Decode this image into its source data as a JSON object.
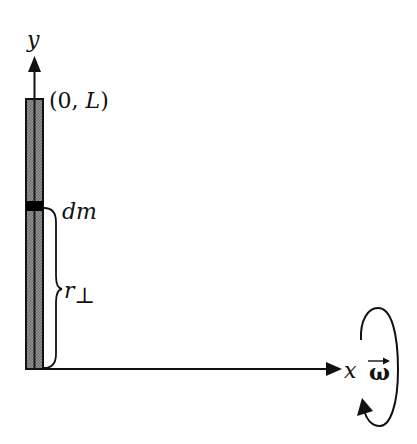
{
  "diagram": {
    "axes": {
      "x_label": "x",
      "y_label": "y"
    },
    "labels": {
      "top_point_open": "(0, ",
      "top_point_var": "L",
      "top_point_close": ")",
      "mass_element": "dm",
      "perp_distance_main": "r",
      "perp_distance_sub": "⊥",
      "angular_velocity": "ω"
    },
    "colors": {
      "ink": "#111111",
      "rod_fill": "#8a8a8a",
      "rod_stripe": "#1a1a1a",
      "mass_band": "#000000",
      "background": "#ffffff"
    }
  }
}
